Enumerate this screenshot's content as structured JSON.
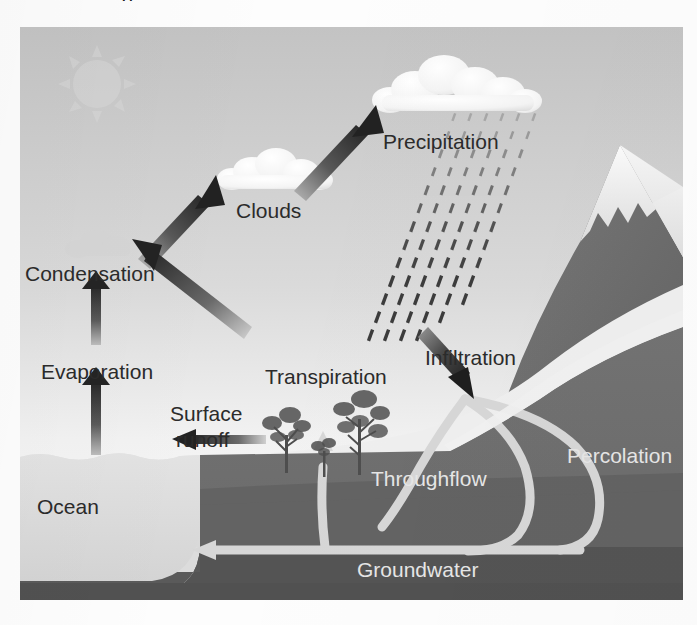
{
  "page": {
    "title_remnant": "g",
    "background_color": "#fdfdfd"
  },
  "diagram": {
    "name": "water-cycle-diagram",
    "frame": {
      "x": 20,
      "y": 27,
      "width": 663,
      "height": 573
    },
    "palette": {
      "sky_top": "#c5c5c5",
      "sky_bottom": "#fbfbfb",
      "ocean": "#dcdcdc",
      "ground_upper": "#6f6f6f",
      "ground_lower": "#5a5a5a",
      "ground_deep": "#515151",
      "mountain": "#6b6b6b",
      "mountain_snow": "#f2f2f2",
      "pipe": "#d6d6d6",
      "arrow_dark": "#2e2e2e",
      "cloud": "#fafafa",
      "sun": "#cfcfcf",
      "label_dark": "#2b2b2b",
      "label_light": "#e6e6e6",
      "rain": "#3a3a3a"
    },
    "labels": [
      {
        "id": "precipitation",
        "text": "Precipitation",
        "x": 363,
        "y": 114,
        "size": 21,
        "tone": "dark"
      },
      {
        "id": "clouds",
        "text": "Clouds",
        "x": 216,
        "y": 183,
        "size": 21,
        "tone": "dark"
      },
      {
        "id": "condensation",
        "text": "Condensation",
        "x": 25,
        "y": 245,
        "size": 21,
        "tone": "dark"
      },
      {
        "id": "evaporation",
        "text": "Evaporation",
        "x": 41,
        "y": 343,
        "size": 21,
        "tone": "dark"
      },
      {
        "id": "transpiration",
        "text": "Transpiration",
        "x": 265,
        "y": 348,
        "size": 21,
        "tone": "dark"
      },
      {
        "id": "infiltration",
        "text": "Infiltration",
        "x": 425,
        "y": 329,
        "size": 21,
        "tone": "dark"
      },
      {
        "id": "surface-runoff-line1",
        "text": "Surface",
        "x": 170,
        "y": 385,
        "size": 21,
        "tone": "dark"
      },
      {
        "id": "surface-runoff-line2",
        "text": "runoff",
        "x": 176,
        "y": 411,
        "size": 21,
        "tone": "dark"
      },
      {
        "id": "percolation",
        "text": "Percolation",
        "x": 567,
        "y": 427,
        "size": 21,
        "tone": "light"
      },
      {
        "id": "throughflow",
        "text": "Throughflow",
        "x": 371,
        "y": 450,
        "size": 21,
        "tone": "light"
      },
      {
        "id": "ocean",
        "text": "Ocean",
        "x": 37,
        "y": 478,
        "size": 21,
        "tone": "dark"
      },
      {
        "id": "groundwater",
        "text": "Groundwater",
        "x": 357,
        "y": 541,
        "size": 21,
        "tone": "light"
      }
    ],
    "processes": [
      {
        "id": "evaporation",
        "from": "Ocean",
        "to": "Condensation",
        "arrow": "up"
      },
      {
        "id": "condensation",
        "from": "Evaporation",
        "to": "Clouds",
        "arrow": "up-right"
      },
      {
        "id": "transpiration",
        "from": "Trees",
        "to": "Condensation",
        "arrow": "up-left"
      },
      {
        "id": "precipitation",
        "from": "Clouds",
        "to": "Precipitation",
        "arrow": "up-right"
      },
      {
        "id": "infiltration",
        "from": "Surface",
        "to": "Ground",
        "arrow": "down-right"
      },
      {
        "id": "surface-runoff",
        "from": "Land",
        "to": "Ocean",
        "arrow": "left"
      },
      {
        "id": "groundwater",
        "from": "Aquifer",
        "to": "Ocean",
        "arrow": "left"
      },
      {
        "id": "throughflow",
        "from": "Infiltration",
        "to": "Root zone",
        "arrow": "up"
      }
    ],
    "features": {
      "sun": "sun-icon",
      "clouds_count": 3,
      "trees_count": 3,
      "rain_band": "diagonal-rain-streaks",
      "mountain": "snow-capped-mountain"
    }
  }
}
